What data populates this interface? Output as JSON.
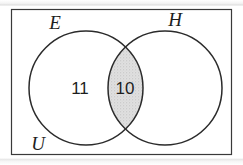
{
  "figure": {
    "type": "venn-diagram",
    "universe_label": "U",
    "border_color": "#3a3a3a",
    "background_color": "#ffffff",
    "shading_color": "#d6d6d6",
    "text_color": "#1e1e1e",
    "sets": [
      {
        "id": "E",
        "label": "E",
        "label_x": 55,
        "label_y": 29,
        "center_x": 86,
        "center_y": 88,
        "radius": 57
      },
      {
        "id": "H",
        "label": "H",
        "label_x": 175,
        "label_y": 26,
        "center_x": 165,
        "center_y": 88,
        "radius": 57
      }
    ],
    "universe": {
      "label": "U",
      "label_x": 38,
      "label_y": 150,
      "rect_x": 11,
      "rect_y": 9,
      "rect_width": 221,
      "rect_height": 146
    },
    "regions": [
      {
        "id": "E-only",
        "name": "E only",
        "value": "11",
        "x": 80,
        "y": 94,
        "shaded": false
      },
      {
        "id": "E-and-H",
        "name": "E intersect H",
        "value": "10",
        "x": 125,
        "y": 94,
        "shaded": true
      },
      {
        "id": "H-only",
        "name": "H only",
        "value": "",
        "x": 190,
        "y": 94,
        "shaded": false
      }
    ]
  }
}
